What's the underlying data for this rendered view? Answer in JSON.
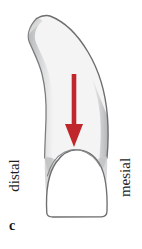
{
  "figure": {
    "letter": "c",
    "caption_letter_style": "bold-lowercase-serif"
  },
  "labels": {
    "left": "distal",
    "right": "mesial"
  },
  "annotation": {
    "arrow_icon": "down-arrow-icon",
    "arrow_color": "#C0272D",
    "arrow_direction": "down",
    "arrow_points_to": "cementoenamel junction"
  },
  "illustration": {
    "subject": "tooth-proximal-view",
    "root_fill": "#F4F4F4",
    "root_shadow": "#B9BABB",
    "crown_fill": "#FFFFFF",
    "outline_color": "#6E6E70",
    "background": "#FFFFFF",
    "parts": [
      {
        "name": "root",
        "fill": "#F4F4F4"
      },
      {
        "name": "crown",
        "fill": "#FFFFFF"
      },
      {
        "name": "cementoenamel-junction",
        "fill": "none"
      }
    ]
  }
}
